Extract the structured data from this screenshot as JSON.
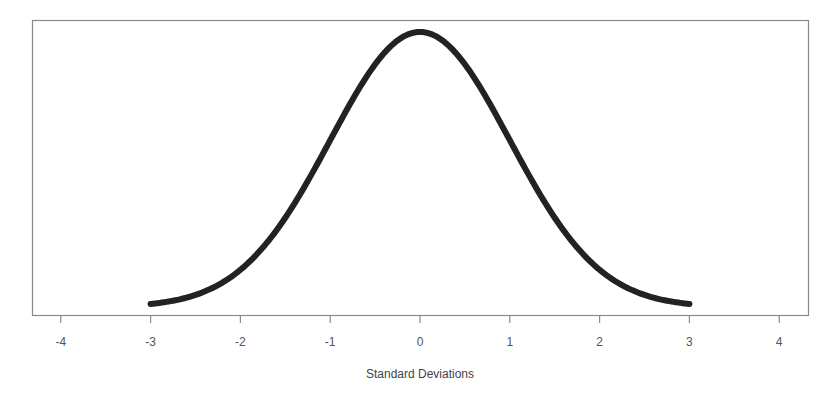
{
  "chart_data": {
    "type": "line",
    "title": "",
    "xlabel": "Standard Deviations",
    "ylabel": "",
    "xlim": [
      -4.3,
      4.3
    ],
    "ylim": [
      0,
      0.42
    ],
    "grid": false,
    "legend": null,
    "x_ticks": [
      -4,
      -3,
      -2,
      -1,
      0,
      1,
      2,
      3,
      4
    ],
    "x_tick_labels": [
      "-4",
      "-3",
      "-2",
      "-1",
      "0",
      "1",
      "2",
      "3",
      "4"
    ],
    "y_ticks": [],
    "series": [
      {
        "name": "Standard normal density",
        "color": "#222222",
        "x": [
          -3,
          -2.5,
          -2,
          -1.5,
          -1,
          -0.5,
          0,
          0.5,
          1,
          1.5,
          2,
          2.5,
          3
        ],
        "y": [
          0.0044,
          0.0175,
          0.054,
          0.1295,
          0.242,
          0.3521,
          0.3989,
          0.3521,
          0.242,
          0.1295,
          0.054,
          0.0175,
          0.0044
        ]
      }
    ]
  },
  "colors": {
    "curve": "#222222",
    "frame": "#8a8a8a",
    "text": "#555555",
    "background": "#ffffff"
  }
}
